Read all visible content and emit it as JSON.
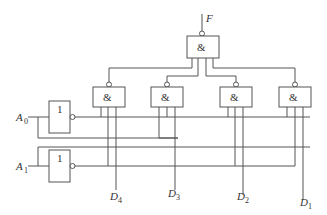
{
  "diagram": {
    "type": "logic-circuit",
    "output_label": "F",
    "inputs": [
      {
        "name": "A",
        "sub": "0"
      },
      {
        "name": "A",
        "sub": "1"
      }
    ],
    "data_inputs": [
      {
        "name": "D",
        "sub": "4"
      },
      {
        "name": "D",
        "sub": "3"
      },
      {
        "name": "D",
        "sub": "2"
      },
      {
        "name": "D",
        "sub": "1"
      }
    ],
    "not_gate_symbol": "1",
    "and_gate_symbol": "&",
    "gates": {
      "output_nand": {
        "symbol": "&",
        "output": "F"
      },
      "nand_gates": [
        "&",
        "&",
        "&",
        "&"
      ],
      "inverters": [
        "1",
        "1"
      ]
    }
  }
}
